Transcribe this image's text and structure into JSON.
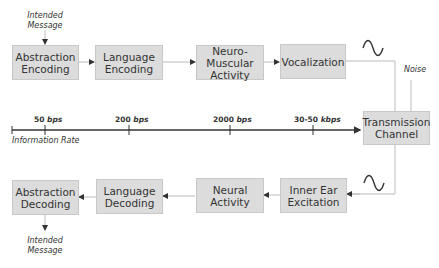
{
  "encoding_chain": [
    {
      "label": "Abstraction\nEncoding",
      "l1": "Abstraction",
      "l2": "Encoding"
    },
    {
      "label": "Language\nEncoding",
      "l1": "Language",
      "l2": "Encoding"
    },
    {
      "label": "Neuro-Muscular\nActivity",
      "l1": "Neuro-Muscular",
      "l2": "Activity"
    },
    {
      "label": "Vocalization",
      "l1": "Vocalization",
      "l2": ""
    }
  ],
  "channel": {
    "l1": "Transmission",
    "l2": "Channel"
  },
  "decoding_chain": [
    {
      "l1": "Abstraction",
      "l2": "Decoding"
    },
    {
      "l1": "Language",
      "l2": "Decoding"
    },
    {
      "l1": "Neural",
      "l2": "Activity"
    },
    {
      "l1": "Inner Ear",
      "l2": "Excitation"
    }
  ],
  "labels": {
    "intended_message_top_l1": "Intended",
    "intended_message_top_l2": "Message",
    "intended_message_bottom_l1": "Intended",
    "intended_message_bottom_l2": "Message",
    "noise": "Noise",
    "information_rate": "Information Rate"
  },
  "rate_axis": {
    "ticks": [
      {
        "num": "50",
        "unit": "bps"
      },
      {
        "num": "200",
        "unit": "bps"
      },
      {
        "num": "2000",
        "unit": "bps"
      },
      {
        "num": "30-50",
        "unit": "kbps"
      }
    ]
  },
  "colors": {
    "box_fill": "#dcdcdc",
    "line": "#bdbdbd",
    "axis": "#333333"
  }
}
